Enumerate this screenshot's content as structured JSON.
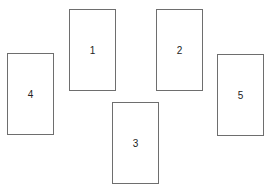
{
  "diagram": {
    "cards": [
      {
        "label": "1",
        "x": 69,
        "y": 9
      },
      {
        "label": "2",
        "x": 156,
        "y": 9
      },
      {
        "label": "3",
        "x": 112,
        "y": 102
      },
      {
        "label": "4",
        "x": 7,
        "y": 53
      },
      {
        "label": "5",
        "x": 217,
        "y": 54
      }
    ],
    "border_color": "#6e6e6e"
  }
}
